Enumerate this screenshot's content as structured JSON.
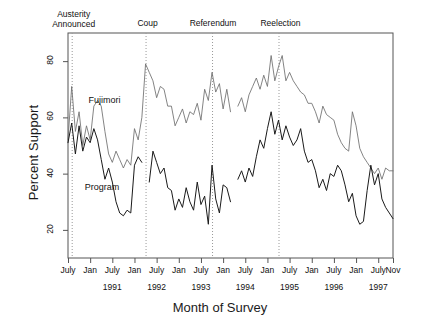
{
  "chart_data": {
    "type": "line",
    "title": "",
    "xlabel": "Month of Survey",
    "ylabel": "Percent Support",
    "ylim": [
      10,
      90
    ],
    "yticks": [
      20,
      40,
      60,
      80
    ],
    "ytick_labels": [
      "20",
      "40",
      "60",
      "80"
    ],
    "xlim": [
      "1990-07",
      "1997-11"
    ],
    "grid": false,
    "legend": "inline-labels",
    "xtick_labels": [
      "July",
      "Jan",
      "July",
      "Jan",
      "July",
      "Jan",
      "July",
      "Jan",
      "July",
      "Jan",
      "July",
      "Jan",
      "July",
      "Jan",
      "July",
      "Nov"
    ],
    "xyear_labels": [
      "1991",
      "1992",
      "1993",
      "1994",
      "1995",
      "1996",
      "1997"
    ],
    "annotations": [
      {
        "label": "Austerity\nAnnounced",
        "line1": "Austerity",
        "line2": "Announced",
        "x_month": "1990-08"
      },
      {
        "label": "Coup",
        "line1": "Coup",
        "line2": "",
        "x_month": "1992-04"
      },
      {
        "label": "Referendum",
        "line1": "Referendum",
        "line2": "",
        "x_month": "1993-10"
      },
      {
        "label": "Reelection",
        "line1": "Reelection",
        "line2": "",
        "x_month": "1995-04"
      }
    ],
    "series": [
      {
        "name": "Fujimori",
        "color": "#6e6e6e",
        "label_x_month": "1990-12",
        "label_y": 66,
        "points": [
          {
            "x": "1990-07",
            "y": 52
          },
          {
            "x": "1990-08",
            "y": 71
          },
          {
            "x": "1990-09",
            "y": 55
          },
          {
            "x": "1990-10",
            "y": 62
          },
          {
            "x": "1990-11",
            "y": 50
          },
          {
            "x": "1990-12",
            "y": 57
          },
          {
            "x": "1991-01",
            "y": 52
          },
          {
            "x": "1991-02",
            "y": 64
          },
          {
            "x": "1991-03",
            "y": 66
          },
          {
            "x": "1991-04",
            "y": 64
          },
          {
            "x": "1991-05",
            "y": 55
          },
          {
            "x": "1991-06",
            "y": 47
          },
          {
            "x": "1991-07",
            "y": 44
          },
          {
            "x": "1991-08",
            "y": 48
          },
          {
            "x": "1991-09",
            "y": 45
          },
          {
            "x": "1991-10",
            "y": 42
          },
          {
            "x": "1991-11",
            "y": 45
          },
          {
            "x": "1991-12",
            "y": 43
          },
          {
            "x": "1992-01",
            "y": 56
          },
          {
            "x": "1992-02",
            "y": 52
          },
          {
            "x": "1992-03",
            "y": 60
          },
          {
            "x": "1992-04",
            "y": 79
          },
          {
            "x": "1992-05",
            "y": 76
          },
          {
            "x": "1992-06",
            "y": 73
          },
          {
            "x": "1992-07",
            "y": 67
          },
          {
            "x": "1992-08",
            "y": 71
          },
          {
            "x": "1992-09",
            "y": 70
          },
          {
            "x": "1992-10",
            "y": 64
          },
          {
            "x": "1992-11",
            "y": 64
          },
          {
            "x": "1992-12",
            "y": 57
          },
          {
            "x": "1993-01",
            "y": 60
          },
          {
            "x": "1993-02",
            "y": 63
          },
          {
            "x": "1993-03",
            "y": 58
          },
          {
            "x": "1993-04",
            "y": 62
          },
          {
            "x": "1993-05",
            "y": 61
          },
          {
            "x": "1993-06",
            "y": 65
          },
          {
            "x": "1993-07",
            "y": 59
          },
          {
            "x": "1993-08",
            "y": 70
          },
          {
            "x": "1993-09",
            "y": 66
          },
          {
            "x": "1993-10",
            "y": 76
          },
          {
            "x": "1993-11",
            "y": 69
          },
          {
            "x": "1993-12",
            "y": 72
          },
          {
            "x": "1994-01",
            "y": 63
          },
          {
            "x": "1994-02",
            "y": 70
          },
          {
            "x": "1994-03",
            "y": 62
          },
          {
            "x": "1994-05",
            "y": 64
          },
          {
            "x": "1994-06",
            "y": 67
          },
          {
            "x": "1994-07",
            "y": 62
          },
          {
            "x": "1994-08",
            "y": 68
          },
          {
            "x": "1994-09",
            "y": 71
          },
          {
            "x": "1994-10",
            "y": 74
          },
          {
            "x": "1994-11",
            "y": 70
          },
          {
            "x": "1994-12",
            "y": 75
          },
          {
            "x": "1995-01",
            "y": 71
          },
          {
            "x": "1995-02",
            "y": 82
          },
          {
            "x": "1995-03",
            "y": 73
          },
          {
            "x": "1995-04",
            "y": 78
          },
          {
            "x": "1995-05",
            "y": 82
          },
          {
            "x": "1995-06",
            "y": 73
          },
          {
            "x": "1995-07",
            "y": 76
          },
          {
            "x": "1995-08",
            "y": 73
          },
          {
            "x": "1995-09",
            "y": 71
          },
          {
            "x": "1995-10",
            "y": 69
          },
          {
            "x": "1995-11",
            "y": 68
          },
          {
            "x": "1995-12",
            "y": 65
          },
          {
            "x": "1996-01",
            "y": 65
          },
          {
            "x": "1996-02",
            "y": 62
          },
          {
            "x": "1996-03",
            "y": 58
          },
          {
            "x": "1996-04",
            "y": 64
          },
          {
            "x": "1996-05",
            "y": 61
          },
          {
            "x": "1996-06",
            "y": 60
          },
          {
            "x": "1996-07",
            "y": 59
          },
          {
            "x": "1996-08",
            "y": 54
          },
          {
            "x": "1996-09",
            "y": 51
          },
          {
            "x": "1996-10",
            "y": 49
          },
          {
            "x": "1996-11",
            "y": 48
          },
          {
            "x": "1996-12",
            "y": 62
          },
          {
            "x": "1997-01",
            "y": 57
          },
          {
            "x": "1997-02",
            "y": 49
          },
          {
            "x": "1997-03",
            "y": 46
          },
          {
            "x": "1997-04",
            "y": 44
          },
          {
            "x": "1997-05",
            "y": 42
          },
          {
            "x": "1997-06",
            "y": 40
          },
          {
            "x": "1997-07",
            "y": 42
          },
          {
            "x": "1997-08",
            "y": 38
          },
          {
            "x": "1997-09",
            "y": 42
          },
          {
            "x": "1997-10",
            "y": 41
          },
          {
            "x": "1997-11",
            "y": 41
          }
        ]
      },
      {
        "name": "Program",
        "color": "#1a1a1a",
        "label_x_month": "1990-11",
        "label_y": 35,
        "points": [
          {
            "x": "1990-07",
            "y": 51
          },
          {
            "x": "1990-08",
            "y": 58
          },
          {
            "x": "1990-09",
            "y": 47
          },
          {
            "x": "1990-10",
            "y": 57
          },
          {
            "x": "1990-11",
            "y": 48
          },
          {
            "x": "1990-12",
            "y": 53
          },
          {
            "x": "1991-01",
            "y": 51
          },
          {
            "x": "1991-02",
            "y": 56
          },
          {
            "x": "1991-03",
            "y": 52
          },
          {
            "x": "1991-04",
            "y": 45
          },
          {
            "x": "1991-05",
            "y": 38
          },
          {
            "x": "1991-06",
            "y": 42
          },
          {
            "x": "1991-07",
            "y": 37
          },
          {
            "x": "1991-08",
            "y": 30
          },
          {
            "x": "1991-09",
            "y": 26
          },
          {
            "x": "1991-10",
            "y": 25
          },
          {
            "x": "1991-11",
            "y": 27
          },
          {
            "x": "1991-12",
            "y": 26
          },
          {
            "x": "1992-01",
            "y": 43
          },
          {
            "x": "1992-02",
            "y": 46
          },
          {
            "x": "1992-03",
            "y": 44
          },
          {
            "x": "1992-05",
            "y": 37
          },
          {
            "x": "1992-06",
            "y": 48
          },
          {
            "x": "1992-07",
            "y": 44
          },
          {
            "x": "1992-08",
            "y": 40
          },
          {
            "x": "1992-09",
            "y": 42
          },
          {
            "x": "1992-10",
            "y": 35
          },
          {
            "x": "1992-11",
            "y": 34
          },
          {
            "x": "1992-12",
            "y": 27
          },
          {
            "x": "1993-01",
            "y": 31
          },
          {
            "x": "1993-02",
            "y": 28
          },
          {
            "x": "1993-03",
            "y": 35
          },
          {
            "x": "1993-04",
            "y": 30
          },
          {
            "x": "1993-05",
            "y": 27
          },
          {
            "x": "1993-06",
            "y": 37
          },
          {
            "x": "1993-07",
            "y": 29
          },
          {
            "x": "1993-08",
            "y": 32
          },
          {
            "x": "1993-09",
            "y": 22
          },
          {
            "x": "1993-10",
            "y": 43
          },
          {
            "x": "1993-11",
            "y": 31
          },
          {
            "x": "1993-12",
            "y": 26
          },
          {
            "x": "1994-01",
            "y": 36
          },
          {
            "x": "1994-02",
            "y": 35
          },
          {
            "x": "1994-03",
            "y": 30
          },
          {
            "x": "1994-05",
            "y": 38
          },
          {
            "x": "1994-06",
            "y": 41
          },
          {
            "x": "1994-07",
            "y": 37
          },
          {
            "x": "1994-08",
            "y": 42
          },
          {
            "x": "1994-09",
            "y": 39
          },
          {
            "x": "1994-10",
            "y": 46
          },
          {
            "x": "1994-11",
            "y": 52
          },
          {
            "x": "1994-12",
            "y": 49
          },
          {
            "x": "1995-01",
            "y": 56
          },
          {
            "x": "1995-02",
            "y": 62
          },
          {
            "x": "1995-03",
            "y": 54
          },
          {
            "x": "1995-04",
            "y": 59
          },
          {
            "x": "1995-05",
            "y": 52
          },
          {
            "x": "1995-06",
            "y": 57
          },
          {
            "x": "1995-07",
            "y": 53
          },
          {
            "x": "1995-08",
            "y": 50
          },
          {
            "x": "1995-09",
            "y": 52
          },
          {
            "x": "1995-10",
            "y": 56
          },
          {
            "x": "1995-11",
            "y": 48
          },
          {
            "x": "1995-12",
            "y": 44
          },
          {
            "x": "1996-01",
            "y": 45
          },
          {
            "x": "1996-02",
            "y": 41
          },
          {
            "x": "1996-03",
            "y": 35
          },
          {
            "x": "1996-04",
            "y": 38
          },
          {
            "x": "1996-05",
            "y": 34
          },
          {
            "x": "1996-06",
            "y": 40
          },
          {
            "x": "1996-07",
            "y": 39
          },
          {
            "x": "1996-08",
            "y": 43
          },
          {
            "x": "1996-09",
            "y": 41
          },
          {
            "x": "1996-10",
            "y": 36
          },
          {
            "x": "1996-11",
            "y": 30
          },
          {
            "x": "1996-12",
            "y": 33
          },
          {
            "x": "1997-01",
            "y": 25
          },
          {
            "x": "1997-02",
            "y": 22
          },
          {
            "x": "1997-03",
            "y": 23
          },
          {
            "x": "1997-04",
            "y": 34
          },
          {
            "x": "1997-05",
            "y": 43
          },
          {
            "x": "1997-06",
            "y": 36
          },
          {
            "x": "1997-07",
            "y": 40
          },
          {
            "x": "1997-08",
            "y": 31
          },
          {
            "x": "1997-09",
            "y": 28
          },
          {
            "x": "1997-10",
            "y": 26
          },
          {
            "x": "1997-11",
            "y": 24
          }
        ]
      }
    ]
  },
  "axes": {
    "ylabel": "Percent Support",
    "xlabel": "Month of Survey"
  },
  "events": {
    "austerity_line1": "Austerity",
    "austerity_line2": "Announced",
    "coup": "Coup",
    "referendum": "Referendum",
    "reelection": "Reelection"
  },
  "series_labels": {
    "fujimori": "Fujimori",
    "program": "Program"
  },
  "yticks": [
    "20",
    "40",
    "60",
    "80"
  ]
}
